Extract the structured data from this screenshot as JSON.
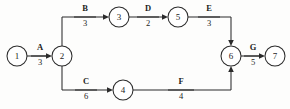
{
  "diagram": {
    "type": "activity-on-arrow-network",
    "colors": {
      "line": "#2b2b2b",
      "node_fill": "#ffffff",
      "text": "#1d1d1d",
      "background": "#fdfdfc"
    },
    "nodes": [
      {
        "id": "n1",
        "label": "1",
        "cx": 17,
        "cy": 56,
        "r": 10
      },
      {
        "id": "n2",
        "label": "2",
        "cx": 62,
        "cy": 56,
        "r": 10
      },
      {
        "id": "n3",
        "label": "3",
        "cx": 119,
        "cy": 17,
        "r": 10
      },
      {
        "id": "n4",
        "label": "4",
        "cx": 123,
        "cy": 90,
        "r": 10
      },
      {
        "id": "n5",
        "label": "5",
        "cx": 178,
        "cy": 17,
        "r": 10
      },
      {
        "id": "n6",
        "label": "6",
        "cx": 231,
        "cy": 56,
        "r": 10
      },
      {
        "id": "n7",
        "label": "7",
        "cx": 275,
        "cy": 56,
        "r": 10
      }
    ],
    "edges": [
      {
        "id": "eA",
        "name": "A",
        "duration": "3",
        "from": "1",
        "to": "2",
        "name_x": 40,
        "name_y": 50,
        "dur_x": 40,
        "dur_y": 65,
        "tick_x1": 31,
        "tick_y1": 56,
        "tick_x2": 49,
        "tick_y2": 56
      },
      {
        "id": "eB",
        "name": "B",
        "duration": "3",
        "from": "2",
        "to": "3",
        "name_x": 85,
        "name_y": 11,
        "dur_x": 85,
        "dur_y": 26,
        "tick_x1": 74,
        "tick_y1": 17,
        "tick_x2": 96,
        "tick_y2": 17
      },
      {
        "id": "eC",
        "name": "C",
        "duration": "6",
        "from": "2",
        "to": "4",
        "name_x": 86,
        "name_y": 84,
        "dur_x": 86,
        "dur_y": 99,
        "tick_x1": 75,
        "tick_y1": 90,
        "tick_x2": 97,
        "tick_y2": 90
      },
      {
        "id": "eD",
        "name": "D",
        "duration": "2",
        "from": "3",
        "to": "5",
        "name_x": 148,
        "name_y": 11,
        "dur_x": 148,
        "dur_y": 26,
        "tick_x1": 137,
        "tick_y1": 17,
        "tick_x2": 159,
        "tick_y2": 17
      },
      {
        "id": "eE",
        "name": "E",
        "duration": "3",
        "from": "5",
        "to": "6",
        "name_x": 209,
        "name_y": 11,
        "dur_x": 209,
        "dur_y": 26,
        "tick_x1": 198,
        "tick_y1": 17,
        "tick_x2": 220,
        "tick_y2": 17
      },
      {
        "id": "eF",
        "name": "F",
        "duration": "4",
        "from": "4",
        "to": "6",
        "name_x": 181,
        "name_y": 84,
        "dur_x": 181,
        "dur_y": 99,
        "tick_x1": 168,
        "tick_y1": 90,
        "tick_x2": 194,
        "tick_y2": 90
      },
      {
        "id": "eG",
        "name": "G",
        "duration": "5",
        "from": "6",
        "to": "7",
        "name_x": 253,
        "name_y": 50,
        "dur_x": 253,
        "dur_y": 65,
        "tick_x1": 244,
        "tick_y1": 56,
        "tick_x2": 262,
        "tick_y2": 56
      }
    ]
  }
}
